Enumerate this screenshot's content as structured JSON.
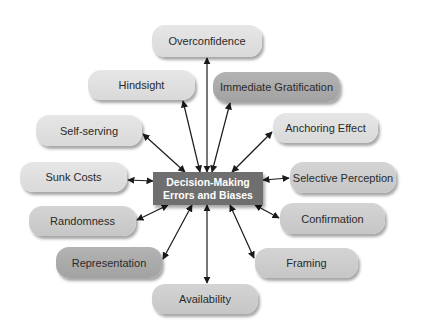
{
  "center": {
    "line1": "Decision-Making",
    "line2": "Errors and Biases",
    "color": "#6f6f6f"
  },
  "nodes": [
    {
      "id": "overconfidence",
      "label": "Overconfidence",
      "x": 152,
      "y": 25,
      "w": 110,
      "h": 32,
      "shade": "light"
    },
    {
      "id": "hindsight",
      "label": "Hindsight",
      "x": 88,
      "y": 70,
      "w": 107,
      "h": 30,
      "shade": "light"
    },
    {
      "id": "immediate-gratification",
      "label": "Immediate Gratification",
      "x": 213,
      "y": 72,
      "w": 127,
      "h": 30,
      "shade": "dark"
    },
    {
      "id": "self-serving",
      "label": "Self-serving",
      "x": 36,
      "y": 115,
      "w": 106,
      "h": 31,
      "shade": "light"
    },
    {
      "id": "anchoring-effect",
      "label": "Anchoring Effect",
      "x": 273,
      "y": 113,
      "w": 105,
      "h": 30,
      "shade": "light"
    },
    {
      "id": "sunk-costs",
      "label": "Sunk Costs",
      "x": 20,
      "y": 162,
      "w": 107,
      "h": 30,
      "shade": "light"
    },
    {
      "id": "selective-perception",
      "label": "Selective Perception",
      "x": 290,
      "y": 162,
      "w": 106,
      "h": 31,
      "shade": "mid"
    },
    {
      "id": "randomness",
      "label": "Randomness",
      "x": 29,
      "y": 206,
      "w": 107,
      "h": 30,
      "shade": "mid"
    },
    {
      "id": "confirmation",
      "label": "Confirmation",
      "x": 280,
      "y": 203,
      "w": 105,
      "h": 31,
      "shade": "mid"
    },
    {
      "id": "representation",
      "label": "Representation",
      "x": 56,
      "y": 247,
      "w": 106,
      "h": 31,
      "shade": "dark"
    },
    {
      "id": "framing",
      "label": "Framing",
      "x": 255,
      "y": 248,
      "w": 103,
      "h": 30,
      "shade": "mid"
    },
    {
      "id": "availability",
      "label": "Availability",
      "x": 152,
      "y": 284,
      "w": 106,
      "h": 30,
      "shade": "mid"
    }
  ],
  "arrows": [
    {
      "to": "overconfidence",
      "x1": 207,
      "y1": 172,
      "x2": 207,
      "y2": 58
    },
    {
      "to": "hindsight",
      "x1": 200,
      "y1": 172,
      "x2": 183,
      "y2": 101
    },
    {
      "to": "immediate-gratification",
      "x1": 212,
      "y1": 172,
      "x2": 230,
      "y2": 103
    },
    {
      "to": "self-serving",
      "x1": 185,
      "y1": 172,
      "x2": 143,
      "y2": 134
    },
    {
      "to": "anchoring-effect",
      "x1": 232,
      "y1": 172,
      "x2": 272,
      "y2": 132
    },
    {
      "to": "sunk-costs",
      "x1": 153,
      "y1": 181,
      "x2": 128,
      "y2": 180
    },
    {
      "to": "selective-perception",
      "x1": 263,
      "y1": 180,
      "x2": 289,
      "y2": 178
    },
    {
      "to": "randomness",
      "x1": 168,
      "y1": 205,
      "x2": 137,
      "y2": 220
    },
    {
      "to": "confirmation",
      "x1": 255,
      "y1": 205,
      "x2": 279,
      "y2": 218
    },
    {
      "to": "representation",
      "x1": 192,
      "y1": 205,
      "x2": 163,
      "y2": 259
    },
    {
      "to": "framing",
      "x1": 230,
      "y1": 205,
      "x2": 254,
      "y2": 258
    },
    {
      "to": "availability",
      "x1": 207,
      "y1": 205,
      "x2": 207,
      "y2": 283
    }
  ]
}
